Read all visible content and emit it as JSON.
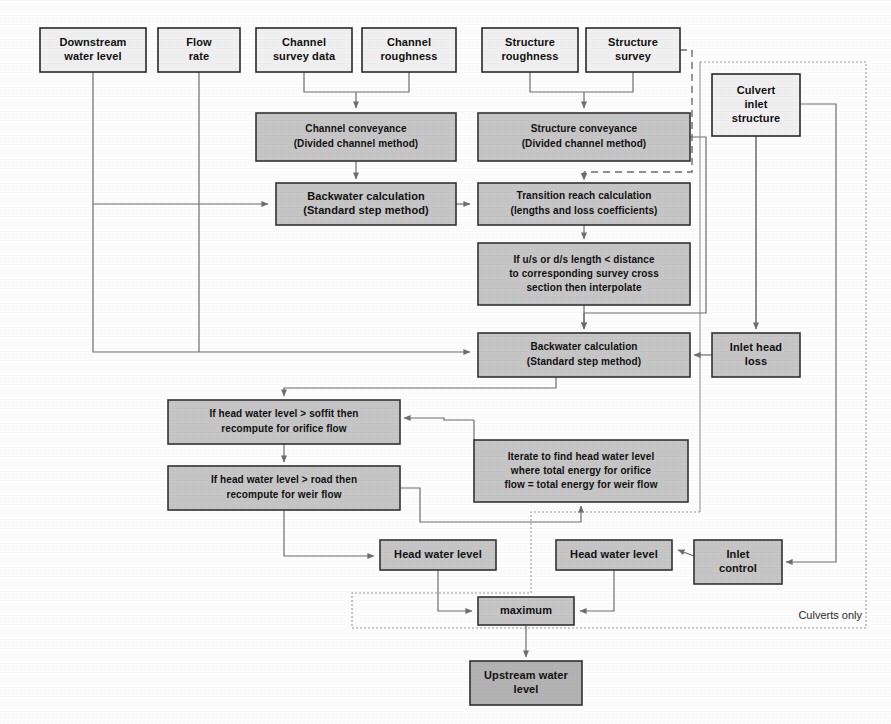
{
  "diagram": {
    "canvas": {
      "width": 891,
      "height": 724
    },
    "colors": {
      "input_box_fill": "#f0f0f0",
      "process_box_fill": "#c6c6c6",
      "output_box_fill": "#b3b3b3",
      "border": "#2a2a2a",
      "connector": "#6e6e6e",
      "region_border": "#9a9a9a"
    },
    "region_label": "Culverts only",
    "nodes": [
      {
        "id": "downstream_water_level",
        "label": "Downstream\nwater level",
        "kind": "input",
        "x": 40,
        "y": 28,
        "w": 106,
        "h": 44
      },
      {
        "id": "flow_rate",
        "label": "Flow\nrate",
        "kind": "input",
        "x": 158,
        "y": 28,
        "w": 82,
        "h": 44
      },
      {
        "id": "channel_survey_data",
        "label": "Channel\nsurvey data",
        "kind": "input",
        "x": 256,
        "y": 28,
        "w": 96,
        "h": 44
      },
      {
        "id": "channel_roughness",
        "label": "Channel\nroughness",
        "kind": "input",
        "x": 362,
        "y": 28,
        "w": 94,
        "h": 44
      },
      {
        "id": "structure_roughness",
        "label": "Structure\nroughness",
        "kind": "input",
        "x": 482,
        "y": 28,
        "w": 96,
        "h": 44
      },
      {
        "id": "structure_survey",
        "label": "Structure\nsurvey",
        "kind": "input",
        "x": 586,
        "y": 28,
        "w": 94,
        "h": 44
      },
      {
        "id": "culvert_inlet_structure",
        "label": "Culvert\ninlet\nstructure",
        "kind": "input",
        "x": 712,
        "y": 74,
        "w": 88,
        "h": 62
      },
      {
        "id": "channel_conveyance",
        "label": "Channel conveyance\n(Divided channel method)",
        "kind": "process",
        "x": 256,
        "y": 113,
        "w": 200,
        "h": 48
      },
      {
        "id": "structure_conveyance",
        "label": "Structure conveyance\n(Divided channel method)",
        "kind": "process",
        "x": 478,
        "y": 113,
        "w": 212,
        "h": 48
      },
      {
        "id": "backwater_calculation_ds",
        "label": "Backwater calculation\n(Standard step method)",
        "kind": "process",
        "x": 276,
        "y": 183,
        "w": 180,
        "h": 42
      },
      {
        "id": "transition_reach_calculation",
        "label": "Transition reach calculation\n(lengths and  loss coefficients)",
        "kind": "process",
        "x": 478,
        "y": 183,
        "w": 212,
        "h": 42
      },
      {
        "id": "interpolate_check",
        "label": "If u/s or d/s length < distance\nto corresponding survey cross\nsection then interpolate",
        "kind": "process",
        "x": 478,
        "y": 243,
        "w": 212,
        "h": 62
      },
      {
        "id": "backwater_calculation_us",
        "label": "Backwater calculation\n(Standard step method)",
        "kind": "process",
        "x": 478,
        "y": 333,
        "w": 212,
        "h": 44
      },
      {
        "id": "inlet_head_loss",
        "label": "Inlet head\nloss",
        "kind": "process",
        "x": 712,
        "y": 333,
        "w": 88,
        "h": 44
      },
      {
        "id": "orifice_flow_check",
        "label": "If head water level > soffit then\nrecompute for orifice flow",
        "kind": "process",
        "x": 168,
        "y": 400,
        "w": 232,
        "h": 44
      },
      {
        "id": "weir_flow_check",
        "label": "If head water level > road then\nrecompute for weir flow",
        "kind": "process",
        "x": 168,
        "y": 466,
        "w": 232,
        "h": 44
      },
      {
        "id": "iterate_energy",
        "label": "Iterate to find head water level\nwhere total energy for orifice\nflow = total energy for weir flow",
        "kind": "process",
        "x": 474,
        "y": 440,
        "w": 214,
        "h": 62
      },
      {
        "id": "head_water_level_left",
        "label": "Head water level",
        "kind": "process",
        "x": 380,
        "y": 540,
        "w": 116,
        "h": 30
      },
      {
        "id": "head_water_level_right",
        "label": "Head water level",
        "kind": "process",
        "x": 556,
        "y": 540,
        "w": 116,
        "h": 30
      },
      {
        "id": "inlet_control",
        "label": "Inlet\ncontrol",
        "kind": "process",
        "x": 694,
        "y": 540,
        "w": 88,
        "h": 44
      },
      {
        "id": "maximum",
        "label": "maximum",
        "kind": "process",
        "x": 478,
        "y": 597,
        "w": 96,
        "h": 28
      },
      {
        "id": "upstream_water_level",
        "label": "Upstream water\nlevel",
        "kind": "output",
        "x": 470,
        "y": 661,
        "w": 112,
        "h": 44
      }
    ],
    "node_labels": {
      "downstream_water_level": [
        "Downstream",
        "water level"
      ],
      "flow_rate": [
        "Flow",
        "rate"
      ],
      "channel_survey_data": [
        "Channel",
        "survey data"
      ],
      "channel_roughness": [
        "Channel",
        "roughness"
      ],
      "structure_roughness": [
        "Structure",
        "roughness"
      ],
      "structure_survey": [
        "Structure",
        "survey"
      ],
      "culvert_inlet_structure": [
        "Culvert",
        "inlet",
        "structure"
      ],
      "channel_conveyance": [
        "Channel conveyance",
        "(Divided channel method)"
      ],
      "structure_conveyance": [
        "Structure conveyance",
        "(Divided channel method)"
      ],
      "backwater_calculation_ds": [
        "Backwater calculation",
        "(Standard step method)"
      ],
      "transition_reach_calculation": [
        "Transition reach calculation",
        "(lengths and  loss coefficients)"
      ],
      "interpolate_check": [
        "If u/s or d/s length < distance",
        "to corresponding survey cross",
        "section then interpolate"
      ],
      "backwater_calculation_us": [
        "Backwater calculation",
        "(Standard step method)"
      ],
      "inlet_head_loss": [
        "Inlet head",
        "loss"
      ],
      "orifice_flow_check": [
        "If head water level > soffit then",
        "recompute for orifice flow"
      ],
      "weir_flow_check": [
        "If head water level > road then",
        "recompute for weir flow"
      ],
      "iterate_energy": [
        "Iterate to find head water level",
        "where total energy for orifice",
        "flow = total energy for weir flow"
      ],
      "head_water_level_left": [
        "Head water level"
      ],
      "head_water_level_right": [
        "Head water level"
      ],
      "inlet_control": [
        "Inlet",
        "control"
      ],
      "maximum": [
        "maximum"
      ],
      "upstream_water_level": [
        "Upstream water",
        "level"
      ]
    },
    "edges": [
      {
        "from": "channel_survey_data",
        "to": "channel_conveyance",
        "style": "solid"
      },
      {
        "from": "channel_roughness",
        "to": "channel_conveyance",
        "style": "solid"
      },
      {
        "from": "structure_roughness",
        "to": "structure_conveyance",
        "style": "solid"
      },
      {
        "from": "structure_survey",
        "to": "structure_conveyance",
        "style": "solid"
      },
      {
        "from": "structure_survey",
        "to": "transition_reach_calculation",
        "style": "dashed"
      },
      {
        "from": "channel_conveyance",
        "to": "backwater_calculation_ds",
        "style": "solid"
      },
      {
        "from": "structure_conveyance",
        "to": "transition_reach_calculation",
        "style": "dashed"
      },
      {
        "from": "structure_conveyance",
        "to": "backwater_calculation_us",
        "style": "solid"
      },
      {
        "from": "downstream_water_level",
        "to": "backwater_calculation_ds",
        "style": "solid"
      },
      {
        "from": "flow_rate",
        "to": "backwater_calculation_ds",
        "style": "solid"
      },
      {
        "from": "downstream_water_level",
        "to": "backwater_calculation_us",
        "style": "solid"
      },
      {
        "from": "flow_rate",
        "to": "backwater_calculation_us",
        "style": "solid"
      },
      {
        "from": "backwater_calculation_ds",
        "to": "transition_reach_calculation",
        "style": "solid"
      },
      {
        "from": "transition_reach_calculation",
        "to": "interpolate_check",
        "style": "solid"
      },
      {
        "from": "interpolate_check",
        "to": "backwater_calculation_us",
        "style": "solid"
      },
      {
        "from": "culvert_inlet_structure",
        "to": "inlet_head_loss",
        "style": "solid"
      },
      {
        "from": "culvert_inlet_structure",
        "to": "inlet_control",
        "style": "solid"
      },
      {
        "from": "inlet_head_loss",
        "to": "backwater_calculation_us",
        "style": "solid"
      },
      {
        "from": "backwater_calculation_us",
        "to": "orifice_flow_check",
        "style": "solid"
      },
      {
        "from": "orifice_flow_check",
        "to": "weir_flow_check",
        "style": "solid"
      },
      {
        "from": "weir_flow_check",
        "to": "iterate_energy",
        "style": "solid"
      },
      {
        "from": "iterate_energy",
        "to": "orifice_flow_check",
        "style": "solid"
      },
      {
        "from": "weir_flow_check",
        "to": "head_water_level_left",
        "style": "solid"
      },
      {
        "from": "inlet_control",
        "to": "head_water_level_right",
        "style": "solid"
      },
      {
        "from": "head_water_level_left",
        "to": "maximum",
        "style": "solid"
      },
      {
        "from": "head_water_level_right",
        "to": "maximum",
        "style": "solid"
      },
      {
        "from": "maximum",
        "to": "upstream_water_level",
        "style": "solid"
      }
    ]
  }
}
